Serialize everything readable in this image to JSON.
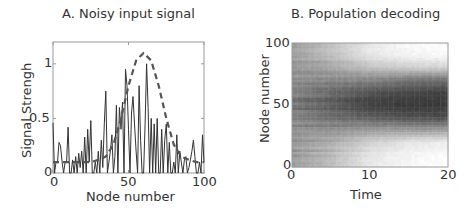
{
  "chart_data": [
    {
      "type": "line",
      "panel": "A",
      "title": "A.  Noisy input signal",
      "xlabel": "Node number",
      "ylabel": "Signal Strengh",
      "xlim": [
        0,
        100
      ],
      "ylim": [
        0,
        1.2
      ],
      "xticks": [
        "0",
        "50",
        "100"
      ],
      "yticks": [
        "0",
        "0.5",
        "1"
      ],
      "grid": false,
      "legend": null,
      "series": [
        {
          "name": "noisy input",
          "style": "solid",
          "color": "#333333",
          "x": [
            0,
            1,
            2,
            3,
            4,
            5,
            6,
            7,
            8,
            9,
            10,
            11,
            12,
            13,
            14,
            15,
            16,
            17,
            18,
            19,
            20,
            21,
            22,
            23,
            24,
            25,
            26,
            27,
            28,
            29,
            30,
            31,
            32,
            33,
            34,
            35,
            36,
            37,
            38,
            39,
            40,
            41,
            42,
            43,
            44,
            45,
            46,
            47,
            48,
            49,
            50,
            51,
            52,
            53,
            54,
            55,
            56,
            57,
            58,
            59,
            60,
            61,
            62,
            63,
            64,
            65,
            66,
            67,
            68,
            69,
            70,
            71,
            72,
            73,
            74,
            75,
            76,
            77,
            78,
            79,
            80,
            81,
            82,
            83,
            84,
            85,
            86,
            87,
            88,
            89,
            90,
            91,
            92,
            93,
            94,
            95,
            96,
            97,
            98,
            99,
            100
          ],
          "y": [
            0.46,
            0.0,
            0.1,
            0.1,
            0.28,
            0.25,
            0.1,
            0.0,
            0.1,
            0.1,
            0.42,
            0.0,
            0.0,
            0.12,
            0.0,
            0.15,
            0.0,
            0.18,
            0.05,
            0.2,
            0.0,
            0.33,
            0.0,
            0.4,
            0.1,
            0.48,
            0.0,
            0.0,
            0.1,
            0.0,
            0.2,
            0.0,
            0.3,
            0.05,
            0.45,
            0.75,
            0.0,
            0.1,
            0.2,
            0.35,
            0.0,
            0.15,
            0.62,
            0.0,
            0.6,
            0.4,
            0.65,
            0.0,
            0.95,
            0.8,
            0.4,
            0.0,
            0.55,
            0.7,
            0.45,
            0.2,
            0.0,
            0.8,
            0.3,
            0.0,
            0.0,
            0.45,
            1.0,
            0.6,
            0.0,
            0.5,
            0.0,
            0.45,
            0.0,
            0.5,
            0.0,
            0.0,
            0.4,
            0.0,
            0.3,
            0.45,
            0.0,
            0.28,
            0.0,
            0.0,
            0.1,
            0.0,
            0.35,
            0.0,
            0.2,
            0.1,
            0.0,
            0.12,
            0.15,
            0.0,
            0.05,
            0.12,
            0.2,
            0.3,
            0.15,
            0.0,
            0.0,
            0.1,
            0.0,
            0.35,
            0.1
          ]
        },
        {
          "name": "underlying signal",
          "style": "dashed",
          "color": "#555555",
          "x": [
            0,
            5,
            10,
            15,
            20,
            25,
            30,
            35,
            40,
            45,
            50,
            55,
            60,
            65,
            70,
            75,
            80,
            85,
            90,
            95,
            100
          ],
          "y": [
            0.1,
            0.1,
            0.1,
            0.1,
            0.1,
            0.1,
            0.12,
            0.15,
            0.26,
            0.5,
            0.8,
            1.03,
            1.1,
            1.03,
            0.8,
            0.5,
            0.26,
            0.15,
            0.12,
            0.1,
            0.1
          ]
        }
      ]
    },
    {
      "type": "heatmap",
      "panel": "B",
      "title": "B.  Population decoding",
      "xlabel": "Time",
      "ylabel": "Node number",
      "xlim": [
        0,
        20
      ],
      "ylim": [
        0,
        100
      ],
      "xticks": [
        "0",
        "10",
        "20"
      ],
      "yticks": [
        "0",
        "50",
        "100"
      ],
      "colormap": "gray (dark = high activity)",
      "description": "Activity starts broadly distributed (gray) at time 0 and sharpens into a dark band centered near node 52 (roughly nodes 30–75) by time 20; regions above ~80 and below ~25 fade to white over time.",
      "x": [
        0,
        5,
        10,
        15,
        20
      ],
      "rows_nodes": [
        0,
        10,
        20,
        30,
        40,
        50,
        60,
        70,
        80,
        90,
        100
      ],
      "values": [
        [
          0.45,
          0.3,
          0.1,
          0.03,
          0.0
        ],
        [
          0.45,
          0.3,
          0.12,
          0.05,
          0.02
        ],
        [
          0.48,
          0.38,
          0.22,
          0.12,
          0.08
        ],
        [
          0.5,
          0.5,
          0.45,
          0.45,
          0.45
        ],
        [
          0.55,
          0.65,
          0.72,
          0.78,
          0.8
        ],
        [
          0.6,
          0.72,
          0.85,
          0.88,
          0.88
        ],
        [
          0.58,
          0.68,
          0.78,
          0.82,
          0.85
        ],
        [
          0.52,
          0.55,
          0.55,
          0.62,
          0.65
        ],
        [
          0.48,
          0.4,
          0.28,
          0.22,
          0.2
        ],
        [
          0.45,
          0.3,
          0.12,
          0.05,
          0.03
        ],
        [
          0.45,
          0.28,
          0.1,
          0.03,
          0.0
        ]
      ]
    }
  ],
  "panels": {
    "a": {
      "title": "A.  Noisy input signal",
      "xlabel": "Node number",
      "ylabel": "Signal Strengh",
      "xticks": [
        "0",
        "50",
        "100"
      ],
      "yticks": [
        "0",
        "0.5",
        "1"
      ]
    },
    "b": {
      "title": "B.  Population decoding",
      "xlabel": "Time",
      "ylabel": "Node number",
      "xticks": [
        "0",
        "10",
        "20"
      ],
      "yticks": [
        "0",
        "50",
        "100"
      ]
    }
  },
  "colors": {
    "axis": "#9a9a9a",
    "signal": "#333333",
    "dashed": "#555555",
    "text": "#333333"
  }
}
